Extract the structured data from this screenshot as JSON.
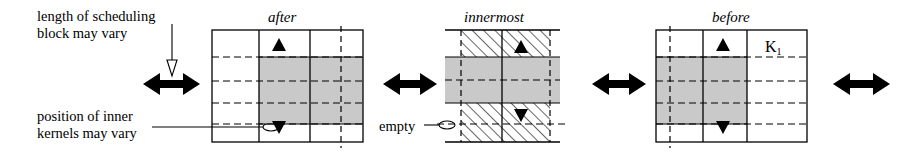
{
  "figure": {
    "type": "schedule-block-diagram",
    "annotations": {
      "length_note_line1": "length of scheduling",
      "length_note_line2": "block may vary",
      "position_note_line1": "position of inner",
      "position_note_line2": "kernels may vary",
      "empty_label": "empty"
    },
    "blocks": [
      {
        "id": "after",
        "title": "after",
        "kernel_label": "",
        "shaded": true,
        "hatched": false,
        "x": 212,
        "y": 30,
        "w": 151,
        "h": 112,
        "columns_x": [
          259,
          310
        ],
        "dashed_vertical_x": [
          341
        ],
        "shade": {
          "x": 259,
          "y": 57,
          "w": 104,
          "h": 67
        },
        "dashed_rows_y": [
          57,
          81,
          103,
          124
        ],
        "solid_rows_y": [],
        "arrow_up_x": 279,
        "arrow_up_y": 44,
        "arrow_down_x": 279,
        "arrow_down_y": 126
      },
      {
        "id": "innermost",
        "title": "innermost",
        "kernel_label": "Kn",
        "kernel_sub": "n",
        "shaded": true,
        "hatched": true,
        "x": 445,
        "y": 30,
        "w": 115,
        "h": 112,
        "columns_x": [
          502
        ],
        "dashed_vertical_x": [
          461,
          550
        ],
        "hatch_x": 461,
        "hatch_w": 89,
        "shade": {
          "x": 445,
          "y": 57,
          "w": 115,
          "h": 46
        },
        "dashed_rows_y": [
          80,
          124
        ],
        "solid_rows_y": [
          57,
          103
        ],
        "arrow_up_x": 521,
        "arrow_up_y": 48,
        "arrow_down_x": 521,
        "arrow_down_y": 115
      },
      {
        "id": "before",
        "title": "before",
        "kernel_label": "K2",
        "kernel_sub": "2",
        "kernel_label2": "K1",
        "kernel_sub2": "1",
        "shaded": true,
        "hatched": false,
        "x": 656,
        "y": 30,
        "w": 151,
        "h": 112,
        "columns_x": [
          703,
          747
        ],
        "dashed_vertical_x": [
          670
        ],
        "shade": {
          "x": 656,
          "y": 57,
          "w": 91,
          "h": 67
        },
        "dashed_rows_y": [
          57,
          81,
          103,
          124
        ],
        "solid_rows_y": [],
        "arrow_up_x": 723,
        "arrow_up_y": 44,
        "arrow_down_x": 723,
        "arrow_down_y": 126
      }
    ],
    "double_arrows": [
      {
        "id": "arrow-left",
        "x": 143,
        "y": 84,
        "w": 57
      },
      {
        "id": "arrow-mid-1",
        "x": 383,
        "y": 84,
        "w": 54
      },
      {
        "id": "arrow-mid-2",
        "x": 592,
        "y": 84,
        "w": 54
      },
      {
        "id": "arrow-right",
        "x": 833,
        "y": 84,
        "w": 57
      }
    ],
    "colors": {
      "shade_gray": "#c9c9c9",
      "line": "#000000",
      "hatch": "#000000",
      "background": "#ffffff"
    }
  }
}
